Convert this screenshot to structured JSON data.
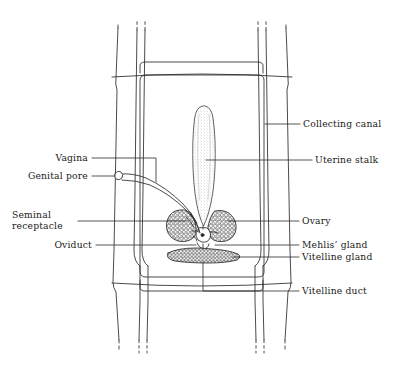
{
  "figure": {
    "type": "anatomical-line-diagram",
    "background": "#ffffff",
    "ink": "#1a1a1a",
    "stipple": "#3a3a3a"
  },
  "labels": {
    "right": [
      {
        "id": "collecting-canal",
        "text": "Collecting canal",
        "x": 304,
        "y": 119,
        "leader": {
          "x1": 265,
          "y1": 124,
          "x2": 300,
          "y2": 124
        }
      },
      {
        "id": "uterine-stalk",
        "text": "Uterine stalk",
        "x": 316,
        "y": 155,
        "leader": {
          "x1": 215,
          "y1": 160,
          "x2": 312,
          "y2": 160
        }
      },
      {
        "id": "ovary",
        "text": "Ovary",
        "x": 303,
        "y": 216,
        "leader": {
          "x1": 228,
          "y1": 221,
          "x2": 299,
          "y2": 221
        }
      },
      {
        "id": "mehlis-gland",
        "text": "Mehlis’ gland",
        "x": 303,
        "y": 240,
        "leader": {
          "x1": 232,
          "y1": 245,
          "x2": 299,
          "y2": 245
        }
      },
      {
        "id": "vitelline-gland",
        "text": "Vitelline gland",
        "x": 303,
        "y": 252,
        "leader": {
          "x1": 238,
          "y1": 257,
          "x2": 299,
          "y2": 257
        }
      },
      {
        "id": "vitelline-duct",
        "text": "Vitelline duct",
        "x": 303,
        "y": 286,
        "leader": {
          "x1": 248,
          "y1": 291,
          "x2": 299,
          "y2": 291
        }
      }
    ],
    "left": [
      {
        "id": "vagina",
        "text": "Vagina",
        "x": 48,
        "y": 153,
        "leader": {
          "x1": 92,
          "y1": 158,
          "x2": 156,
          "y2": 158
        }
      },
      {
        "id": "genital-pore",
        "text": "Genital pore",
        "x": 10,
        "y": 171,
        "leader": {
          "x1": 92,
          "y1": 176,
          "x2": 120,
          "y2": 176
        }
      },
      {
        "id": "seminal-receptacle",
        "text": "Seminal\nreceptacle",
        "x": 14,
        "y": 198,
        "leader": {
          "x1": 78,
          "y1": 221,
          "x2": 174,
          "y2": 221
        }
      },
      {
        "id": "oviduct",
        "text": "Oviduct",
        "x": 52,
        "y": 240,
        "leader": {
          "x1": 96,
          "y1": 245,
          "x2": 190,
          "y2": 245
        }
      }
    ]
  },
  "structures": [
    {
      "id": "body-wall-left",
      "name": "left body margin"
    },
    {
      "id": "body-wall-right",
      "name": "right body margin"
    },
    {
      "id": "proglottid-boundary",
      "name": "proglottid segment outline"
    },
    {
      "id": "collecting-canal-left",
      "name": "left excretory collecting canal"
    },
    {
      "id": "collecting-canal-right",
      "name": "right excretory collecting canal"
    },
    {
      "id": "uterine-stalk-organ",
      "name": "uterine stalk"
    },
    {
      "id": "ovary-lobe-left",
      "name": "left ovarian lobe"
    },
    {
      "id": "ovary-lobe-right",
      "name": "right ovarian lobe"
    },
    {
      "id": "vitelline-gland-band",
      "name": "vitelline gland"
    },
    {
      "id": "mehlis-gland-organ",
      "name": "Mehlis' gland"
    },
    {
      "id": "vagina-tube",
      "name": "vagina"
    },
    {
      "id": "genital-pore-notch",
      "name": "genital pore"
    }
  ]
}
